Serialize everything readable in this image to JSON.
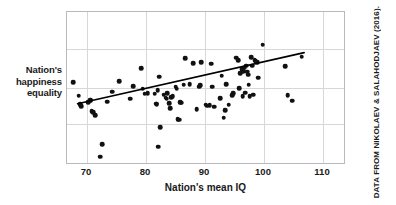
{
  "figure": {
    "credit": "DATA FROM NIKOLAEV & SALAHODJAEV (2016).",
    "ylabel_lines": [
      "Nation's",
      "happiness",
      "equality"
    ],
    "colors": {
      "point": "#111111",
      "frame": "#b9b9bd",
      "grid": "#d7d7db",
      "trend": "#000000",
      "text": "#1a1a1a",
      "background": "#ffffff"
    }
  },
  "chart_data": {
    "type": "scatter",
    "title": "",
    "xlabel": "Nation's mean IQ",
    "ylabel": "Nation's happiness equality",
    "xticks": [
      70,
      80,
      90,
      100,
      110
    ],
    "xticklabels": [
      "70",
      "80",
      "90",
      "100",
      "110"
    ],
    "yticks": [],
    "yticklabels": [],
    "xlim": [
      66.6,
      113.9
    ],
    "ylim": [
      0,
      100
    ],
    "grid": true,
    "grid_axis": "both",
    "legend": null,
    "annotations": [],
    "trendline": {
      "type": "linear",
      "x": [
        68.4,
        107.1
      ],
      "y": [
        39.3,
        73.1
      ],
      "color": "#000000",
      "width": 1.6
    },
    "series": [
      {
        "name": "nations",
        "marker": "circle",
        "color": "#111111",
        "points": [
          [
            67.7,
            54.0
          ],
          [
            68.6,
            45.4
          ],
          [
            68.8,
            39.8
          ],
          [
            69.0,
            38.5
          ],
          [
            70.2,
            41.0
          ],
          [
            70.5,
            42.2
          ],
          [
            70.6,
            42.5
          ],
          [
            70.8,
            35.0
          ],
          [
            71.0,
            34.5
          ],
          [
            71.4,
            32.4
          ],
          [
            72.2,
            5.5
          ],
          [
            72.6,
            13.5
          ],
          [
            73.4,
            41.5
          ],
          [
            74.3,
            48.0
          ],
          [
            75.4,
            54.8
          ],
          [
            77.3,
            43.4
          ],
          [
            77.8,
            51.4
          ],
          [
            79.2,
            63.2
          ],
          [
            79.4,
            50.0
          ],
          [
            79.8,
            46.7
          ],
          [
            80.3,
            46.9
          ],
          [
            81.5,
            46.5
          ],
          [
            81.7,
            40.0
          ],
          [
            81.8,
            39.7
          ],
          [
            82.0,
            48.7
          ],
          [
            82.1,
            12.0
          ],
          [
            82.2,
            57.7
          ],
          [
            82.4,
            24.6
          ],
          [
            83.0,
            46.0
          ],
          [
            83.3,
            44.0
          ],
          [
            83.5,
            43.4
          ],
          [
            83.6,
            47.0
          ],
          [
            83.9,
            40.3
          ],
          [
            84.1,
            37.2
          ],
          [
            84.3,
            44.2
          ],
          [
            84.5,
            45.1
          ],
          [
            85.0,
            51.2
          ],
          [
            85.2,
            50.0
          ],
          [
            85.4,
            29.8
          ],
          [
            85.6,
            29.5
          ],
          [
            85.8,
            41.0
          ],
          [
            86.0,
            40.6
          ],
          [
            86.4,
            52.4
          ],
          [
            86.6,
            69.8
          ],
          [
            87.4,
            53.0
          ],
          [
            88.0,
            66.5
          ],
          [
            88.6,
            36.3
          ],
          [
            89.0,
            51.3
          ],
          [
            89.2,
            52.0
          ],
          [
            89.4,
            67.0
          ],
          [
            90.1,
            39.5
          ],
          [
            90.4,
            38.8
          ],
          [
            90.8,
            39.1
          ],
          [
            91.0,
            66.3
          ],
          [
            91.2,
            51.3
          ],
          [
            91.6,
            38.0
          ],
          [
            92.6,
            43.5
          ],
          [
            92.8,
            58.4
          ],
          [
            93.2,
            30.8
          ],
          [
            93.4,
            36.0
          ],
          [
            93.6,
            52.7
          ],
          [
            94.0,
            39.3
          ],
          [
            94.6,
            45.7
          ],
          [
            94.8,
            47.0
          ],
          [
            95.3,
            70.0
          ],
          [
            95.6,
            68.4
          ],
          [
            95.8,
            50.3
          ],
          [
            96.0,
            59.9
          ],
          [
            96.2,
            62.5
          ],
          [
            96.4,
            44.8
          ],
          [
            96.5,
            61.2
          ],
          [
            96.6,
            63.5
          ],
          [
            96.8,
            47.2
          ],
          [
            97.0,
            65.0
          ],
          [
            97.2,
            61.0
          ],
          [
            97.3,
            59.0
          ],
          [
            97.4,
            52.4
          ],
          [
            97.6,
            45.0
          ],
          [
            97.8,
            70.5
          ],
          [
            98.0,
            64.9
          ],
          [
            98.2,
            46.0
          ],
          [
            98.4,
            68.5
          ],
          [
            98.6,
            67.8
          ],
          [
            98.8,
            67.0
          ],
          [
            99.0,
            57.0
          ],
          [
            99.8,
            78.5
          ],
          [
            103.6,
            64.4
          ],
          [
            104.0,
            45.5
          ],
          [
            104.8,
            42.0
          ],
          [
            106.4,
            70.8
          ]
        ]
      }
    ]
  }
}
